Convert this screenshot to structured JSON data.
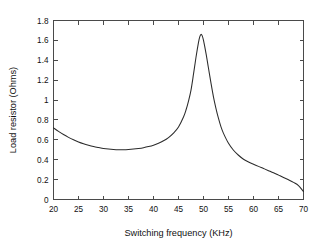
{
  "chart_data": {
    "type": "line",
    "title": "",
    "xlabel": "Switching frequency (KHz)",
    "ylabel": "Load resistor (Ohms)",
    "xlim": [
      20,
      70
    ],
    "ylim": [
      0,
      1.8
    ],
    "xticks": [
      20,
      25,
      30,
      35,
      40,
      45,
      50,
      55,
      60,
      65,
      70
    ],
    "xtick_labels": [
      "20",
      "25",
      "30",
      "35",
      "40",
      "45",
      "50",
      "55",
      "60",
      "65",
      "70"
    ],
    "yticks": [
      0,
      0.2,
      0.4,
      0.6,
      0.8,
      1,
      1.2,
      1.4,
      1.6,
      1.8
    ],
    "ytick_labels": [
      "0",
      "0.2",
      "0.4",
      "0.6",
      "0.8",
      "1",
      "1.2",
      "1.4",
      "1.6",
      "1.8"
    ],
    "grid": false,
    "legend": false,
    "frame": "box",
    "tick_direction": "in",
    "line_color": "#2b2b2b",
    "background_color": "#ffffff",
    "series": [
      {
        "name": "Load resistor",
        "x": [
          20,
          21,
          22,
          23,
          24,
          25,
          26,
          27,
          28,
          29,
          30,
          31,
          32,
          33,
          34,
          35,
          36,
          37,
          38,
          39,
          40,
          41,
          42,
          43,
          44,
          45,
          46,
          46.5,
          47,
          47.5,
          48,
          48.5,
          49,
          49.25,
          49.5,
          49.75,
          50,
          50.5,
          51,
          51.5,
          52,
          52.5,
          53,
          53.5,
          54,
          55,
          56,
          57,
          58,
          59,
          60,
          61,
          62,
          63,
          64,
          65,
          66,
          67,
          68,
          69,
          70
        ],
        "y": [
          0.72,
          0.685,
          0.653,
          0.625,
          0.6,
          0.578,
          0.56,
          0.545,
          0.532,
          0.522,
          0.513,
          0.507,
          0.503,
          0.501,
          0.501,
          0.503,
          0.507,
          0.513,
          0.521,
          0.532,
          0.546,
          0.565,
          0.59,
          0.623,
          0.668,
          0.73,
          0.83,
          0.9,
          0.99,
          1.1,
          1.26,
          1.43,
          1.58,
          1.635,
          1.66,
          1.645,
          1.6,
          1.47,
          1.32,
          1.17,
          1.03,
          0.915,
          0.815,
          0.73,
          0.665,
          0.565,
          0.495,
          0.445,
          0.405,
          0.378,
          0.355,
          0.333,
          0.312,
          0.29,
          0.268,
          0.245,
          0.222,
          0.198,
          0.172,
          0.14,
          0.08
        ]
      }
    ],
    "annotations": {
      "minimum": {
        "x": 33,
        "y": 0.5
      },
      "peak": {
        "x": 49.5,
        "y": 1.66
      },
      "start": {
        "x": 20,
        "y": 0.72
      },
      "end": {
        "x": 70,
        "y": 0.08
      }
    }
  }
}
